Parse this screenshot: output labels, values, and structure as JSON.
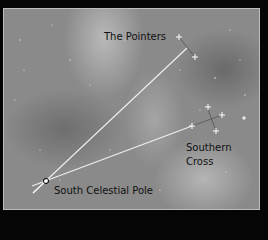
{
  "diagram": {
    "labels": {
      "pointers": "The Pointers",
      "southern_cross_1": "Southern",
      "southern_cross_2": "Cross",
      "pole": "South Celestial Pole"
    },
    "colors": {
      "background": "#050505",
      "sky": "#8a8a8a",
      "lines": "#f0f0f0",
      "text": "#111111"
    }
  }
}
